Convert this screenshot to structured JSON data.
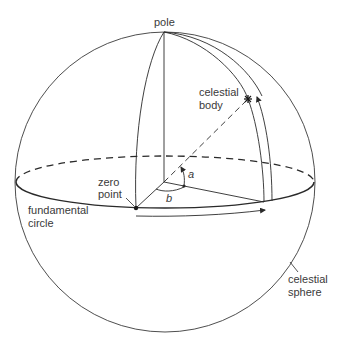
{
  "diagram": {
    "labels": {
      "pole": "pole",
      "celestial_body_line1": "celestial",
      "celestial_body_line2": "body",
      "zero_point_line1": "zero",
      "zero_point_line2": "point",
      "fundamental_circle_line1": "fundamental",
      "fundamental_circle_line2": "circle",
      "celestial_sphere_line1": "celestial",
      "celestial_sphere_line2": "sphere",
      "angle_a": "a",
      "angle_b": "b"
    },
    "colors": {
      "stroke": "#2a2a2a",
      "text": "#3a3a3a",
      "background": "#ffffff"
    },
    "geometry": {
      "sphere_center": [
        165,
        182
      ],
      "sphere_radius": 150,
      "equator_rx": 149,
      "equator_ry": 26,
      "pole": [
        164,
        32
      ],
      "celestial_body": [
        248,
        99
      ],
      "zero_point": [
        136,
        208
      ],
      "foot_point": [
        264,
        202
      ]
    }
  }
}
